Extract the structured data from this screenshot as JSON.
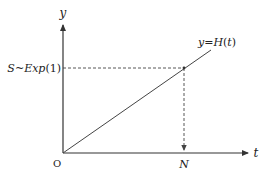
{
  "diagram": {
    "type": "function-plot",
    "colors": {
      "axis": "#333333",
      "line": "#444444",
      "dashed": "#444444",
      "text": "#222222",
      "background": "#ffffff"
    },
    "axes": {
      "x_label": "t",
      "y_label": "y",
      "origin_label": "O"
    },
    "curve": {
      "label": "y=H(t)",
      "label_parts": {
        "lhs": "y",
        "eq": "=",
        "func": "H",
        "open": "(",
        "arg": "t",
        "close": ")"
      }
    },
    "threshold": {
      "label": "S~Exp(1)",
      "label_parts": {
        "var": "S",
        "tilde": "~",
        "dist": "Exp",
        "param": "(1)"
      }
    },
    "intersection": {
      "x_label": "N"
    }
  }
}
